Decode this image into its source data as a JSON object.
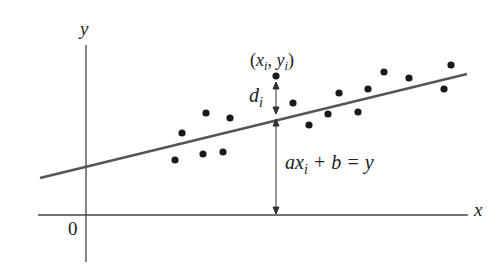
{
  "chart_data": {
    "type": "scatter",
    "title": "",
    "xlabel": "x",
    "ylabel": "y",
    "origin_label": "0",
    "grid": false,
    "legend": null,
    "points_px": [
      [
        175,
        160
      ],
      [
        182,
        133
      ],
      [
        206,
        113
      ],
      [
        203,
        154
      ],
      [
        223,
        152
      ],
      [
        230,
        118
      ],
      [
        276,
        76
      ],
      [
        293,
        103
      ],
      [
        309,
        125
      ],
      [
        328,
        114
      ],
      [
        339,
        93
      ],
      [
        358,
        112
      ],
      [
        368,
        89
      ],
      [
        384,
        72
      ],
      [
        409,
        78
      ],
      [
        444,
        89
      ],
      [
        451,
        65
      ]
    ],
    "regression_line": {
      "equation": "ax_i + b = y",
      "from_px": [
        40,
        178
      ],
      "to_px": [
        467,
        74
      ]
    },
    "annotations": {
      "highlighted_point": "(x_i, y_i)",
      "residual": "d_i",
      "line_equation": "ax_i + b = y"
    }
  },
  "labels": {
    "y_axis": "y",
    "x_axis": "x",
    "origin": "0",
    "point_x": "x",
    "point_y": "y",
    "sub_i": "i",
    "residual_d": "d",
    "eq_a": "a",
    "eq_x": "x",
    "eq_rest": " + b = y"
  },
  "colors": {
    "ink": "#222222",
    "line": "#555555"
  }
}
